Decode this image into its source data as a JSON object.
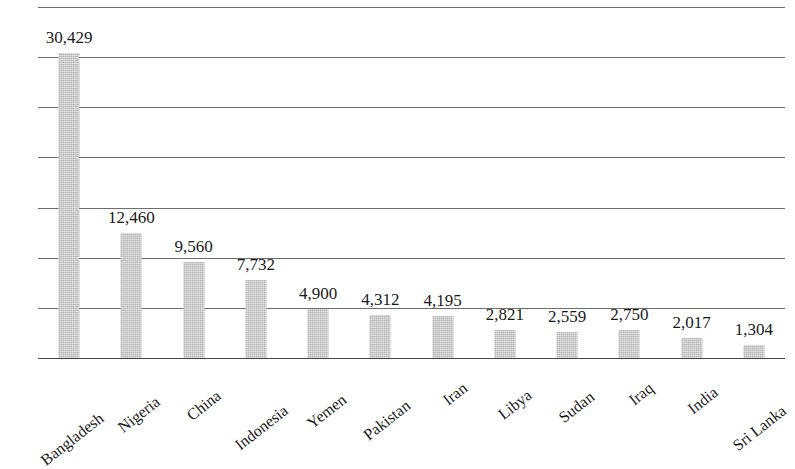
{
  "chart_data": {
    "type": "bar",
    "title": "",
    "subtitle": "",
    "xlabel": "",
    "ylabel": "",
    "categories": [
      "Bangladesh",
      "Nigeria",
      "China",
      "Indonesia",
      "Yemen",
      "Pakistan",
      "Iran",
      "Libya",
      "Sudan",
      "Iraq",
      "India",
      "Sri Lanka"
    ],
    "values": [
      30429,
      12460,
      9560,
      7732,
      4900,
      4312,
      4195,
      2821,
      2559,
      2750,
      2017,
      1304
    ],
    "value_labels": [
      "30,429",
      "12,460",
      "9,560",
      "7,732",
      "4,900",
      "4,312",
      "4,195",
      "2,821",
      "2,559",
      "2,750",
      "2,017",
      "1,304"
    ],
    "ylim": [
      0,
      35000
    ],
    "y_gridline_values": [
      35000,
      30000,
      25000,
      20000,
      15000,
      10000,
      5000,
      0
    ],
    "y_tick_labels": [],
    "grid": true,
    "legend": false,
    "legend_position": "none",
    "bar_color": "#c9c9c9",
    "gridline_color": "#6e6e6e",
    "axis_color": "#444444",
    "text_color": "#1a1a1a",
    "annotations": []
  },
  "figure": {
    "background_color": "#ffffff",
    "value_label_position": "above-bar",
    "category_label_rotation_degrees": -38
  }
}
